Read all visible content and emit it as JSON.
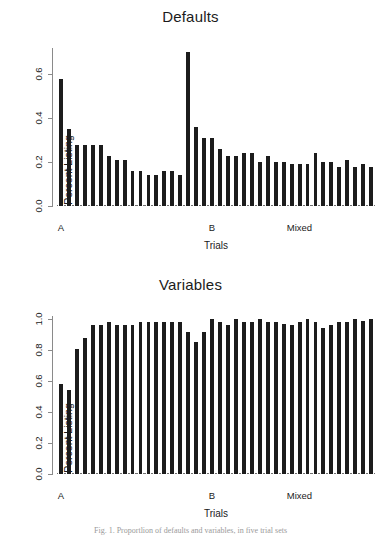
{
  "figure": {
    "caption": "Fig. 1.  Proportlion of defaults and variables, in five trial sets"
  },
  "chart_data": [
    {
      "type": "bar",
      "title": "Defaults",
      "xlabel": "Trials",
      "ylabel": "Percent Listing",
      "ylim": [
        0.0,
        0.72
      ],
      "yticks": [
        "0.0",
        "0.2",
        "0.4",
        "0.6"
      ],
      "ytick_values": [
        0.0,
        0.2,
        0.4,
        0.6
      ],
      "xtick_labels": [
        "A",
        "B",
        "Mixed"
      ],
      "xtick_positions": [
        0,
        19,
        30
      ],
      "grid": false,
      "legend": null,
      "bar_color": "#1c1c1c",
      "values": [
        0.58,
        0.35,
        0.28,
        0.28,
        0.28,
        0.28,
        0.23,
        0.21,
        0.21,
        0.16,
        0.16,
        0.14,
        0.14,
        0.16,
        0.16,
        0.14,
        0.7,
        0.36,
        0.31,
        0.31,
        0.26,
        0.23,
        0.23,
        0.24,
        0.24,
        0.2,
        0.23,
        0.2,
        0.2,
        0.19,
        0.19,
        0.19,
        0.24,
        0.2,
        0.2,
        0.18,
        0.21,
        0.18,
        0.19,
        0.18
      ]
    },
    {
      "type": "bar",
      "title": "Variables",
      "xlabel": "Trials",
      "ylabel": "Percent Listing",
      "ylim": [
        0.0,
        1.02
      ],
      "yticks": [
        "0.0",
        "0.2",
        "0.4",
        "0.6",
        "0.8",
        "1.0"
      ],
      "ytick_values": [
        0.0,
        0.2,
        0.4,
        0.6,
        0.8,
        1.0
      ],
      "xtick_labels": [
        "A",
        "B",
        "Mixed"
      ],
      "xtick_positions": [
        0,
        19,
        30
      ],
      "grid": false,
      "legend": null,
      "bar_color": "#1c1c1c",
      "values": [
        0.58,
        0.54,
        0.81,
        0.88,
        0.96,
        0.96,
        0.98,
        0.96,
        0.96,
        0.96,
        0.98,
        0.98,
        0.98,
        0.98,
        0.98,
        0.98,
        0.92,
        0.85,
        0.92,
        1.0,
        0.98,
        0.96,
        1.0,
        0.98,
        0.98,
        1.0,
        0.98,
        0.98,
        0.97,
        0.96,
        0.98,
        1.0,
        0.98,
        0.94,
        0.96,
        0.98,
        0.98,
        1.0,
        0.99,
        1.0
      ]
    }
  ]
}
